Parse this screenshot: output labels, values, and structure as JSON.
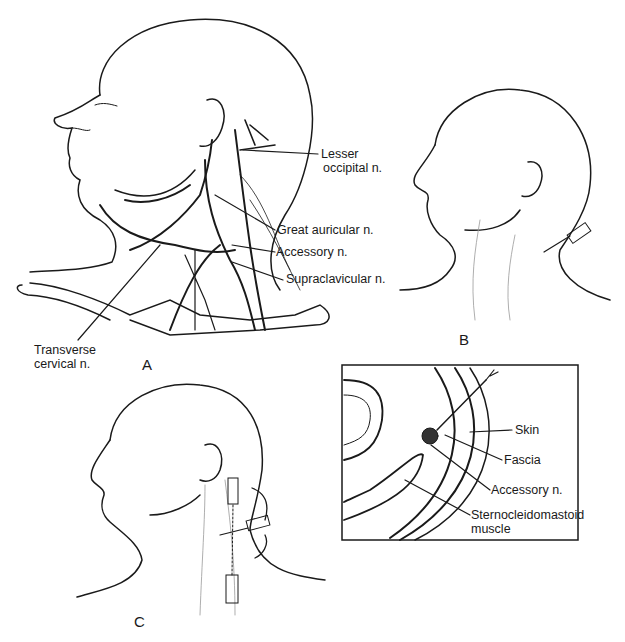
{
  "figure": {
    "panels": [
      {
        "id": "A",
        "label": "A"
      },
      {
        "id": "B",
        "label": "B"
      },
      {
        "id": "C",
        "label": "C"
      }
    ],
    "panel_a_labels": {
      "lesser_occipital_1": "Lesser",
      "lesser_occipital_2": "occipital n.",
      "great_auricular": "Great auricular n.",
      "accessory": "Accessory n.",
      "supraclavicular": "Supraclavicular n.",
      "transverse_cervical_1": "Transverse",
      "transverse_cervical_2": "cervical n."
    },
    "inset_labels": {
      "skin": "Skin",
      "fascia": "Fascia",
      "accessory": "Accessory n.",
      "scm_1": "Sternocleidomastoid",
      "scm_2": "muscle"
    }
  }
}
